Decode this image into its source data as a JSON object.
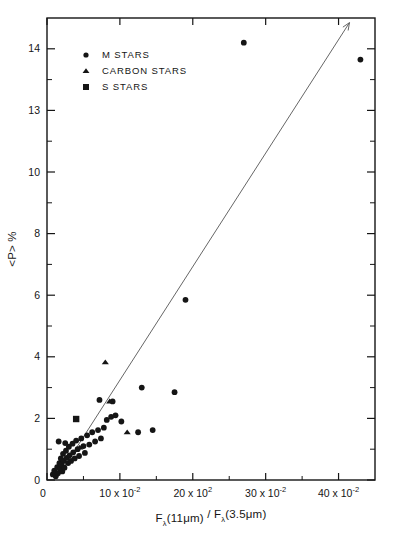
{
  "chart_data": {
    "type": "scatter",
    "title": "",
    "xlabel": "Fλ(11μm) / Fλ(3.5μm)",
    "ylabel": "<P> %",
    "xlim": [
      0,
      45
    ],
    "ylim": [
      0,
      15
    ],
    "grid": false,
    "legend_position": "upper-left",
    "x_tick_labels": [
      {
        "value": 0,
        "text": "0",
        "mantissa": "",
        "times": "",
        "base": "",
        "exponent": ""
      },
      {
        "value": 10,
        "text": "10 x 10-2",
        "mantissa": "10",
        "times": "x",
        "base": "10",
        "exponent": "-2"
      },
      {
        "value": 20,
        "text": "20 x 102",
        "mantissa": "20",
        "times": "x",
        "base": "10",
        "exponent": "2"
      },
      {
        "value": 30,
        "text": "30 x 10-2",
        "mantissa": "30",
        "times": "x",
        "base": "10",
        "exponent": "-2"
      },
      {
        "value": 40,
        "text": "40 x 10-2",
        "mantissa": "40",
        "times": "x",
        "base": "10",
        "exponent": "-2"
      }
    ],
    "x_minor_ticks": [
      5,
      15,
      25,
      35
    ],
    "y_tick_labels": [
      {
        "value": 0,
        "text": "0"
      },
      {
        "value": 2,
        "text": "2"
      },
      {
        "value": 4,
        "text": "4"
      },
      {
        "value": 6,
        "text": "6"
      },
      {
        "value": 8,
        "text": "8"
      },
      {
        "value": 10,
        "text": "10"
      },
      {
        "value": 12,
        "text": "13"
      },
      {
        "value": 14,
        "text": "14"
      }
    ],
    "y_minor_ticks": [
      1,
      3,
      5,
      7,
      9,
      11,
      13
    ],
    "trendline": {
      "x0": 1.2,
      "y0": 0.0,
      "x1": 41.5,
      "y1": 14.85,
      "arrow": true
    },
    "series": [
      {
        "name": "M STARS",
        "marker": "circle",
        "color": "#111111",
        "points": [
          [
            0.8,
            0.18
          ],
          [
            1.0,
            0.3
          ],
          [
            1.2,
            0.12
          ],
          [
            1.4,
            0.42
          ],
          [
            1.5,
            0.22
          ],
          [
            1.7,
            0.55
          ],
          [
            1.8,
            0.35
          ],
          [
            1.9,
            0.7
          ],
          [
            2.0,
            0.5
          ],
          [
            2.1,
            0.28
          ],
          [
            2.2,
            0.85
          ],
          [
            2.3,
            0.62
          ],
          [
            2.4,
            0.4
          ],
          [
            2.6,
            0.95
          ],
          [
            2.7,
            0.72
          ],
          [
            2.9,
            0.55
          ],
          [
            3.0,
            1.08
          ],
          [
            3.1,
            0.8
          ],
          [
            3.3,
            0.62
          ],
          [
            3.5,
            1.18
          ],
          [
            3.6,
            0.9
          ],
          [
            3.8,
            0.7
          ],
          [
            4.0,
            1.28
          ],
          [
            4.2,
            1.0
          ],
          [
            4.4,
            0.78
          ],
          [
            4.7,
            1.35
          ],
          [
            5.0,
            1.1
          ],
          [
            5.2,
            0.88
          ],
          [
            5.5,
            1.45
          ],
          [
            5.8,
            1.15
          ],
          [
            6.2,
            1.55
          ],
          [
            6.6,
            1.25
          ],
          [
            7.0,
            1.62
          ],
          [
            7.4,
            1.35
          ],
          [
            7.8,
            1.7
          ],
          [
            8.2,
            1.95
          ],
          [
            8.8,
            2.05
          ],
          [
            9.4,
            2.1
          ],
          [
            1.6,
            1.25
          ],
          [
            2.5,
            1.2
          ],
          [
            7.2,
            2.6
          ],
          [
            9.0,
            2.55
          ],
          [
            10.2,
            1.9
          ],
          [
            12.5,
            1.55
          ],
          [
            14.5,
            1.62
          ],
          [
            13.0,
            3.0
          ],
          [
            17.5,
            2.85
          ],
          [
            19.0,
            5.85
          ],
          [
            27.0,
            14.2
          ],
          [
            43.0,
            13.65
          ]
        ]
      },
      {
        "name": "CARBON STARS",
        "marker": "triangle",
        "color": "#111111",
        "points": [
          [
            4.5,
            1.05
          ],
          [
            8.6,
            2.55
          ],
          [
            8.0,
            3.82
          ],
          [
            11.0,
            1.55
          ]
        ]
      },
      {
        "name": "S STARS",
        "marker": "square",
        "color": "#111111",
        "points": [
          [
            4.0,
            1.98
          ]
        ]
      }
    ]
  },
  "legend": {
    "entries": [
      {
        "label": "M STARS",
        "marker": "circle"
      },
      {
        "label": "CARBON STARS",
        "marker": "triangle"
      },
      {
        "label": "S STARS",
        "marker": "square"
      }
    ]
  },
  "xaxis_title_parts": {
    "f1": "F",
    "sub1": "λ",
    "arg1": "(11μm)",
    "divider": "/",
    "f2": "F",
    "sub2": "λ",
    "arg2": "(3.5μm)"
  },
  "yaxis_title": "<P> %"
}
